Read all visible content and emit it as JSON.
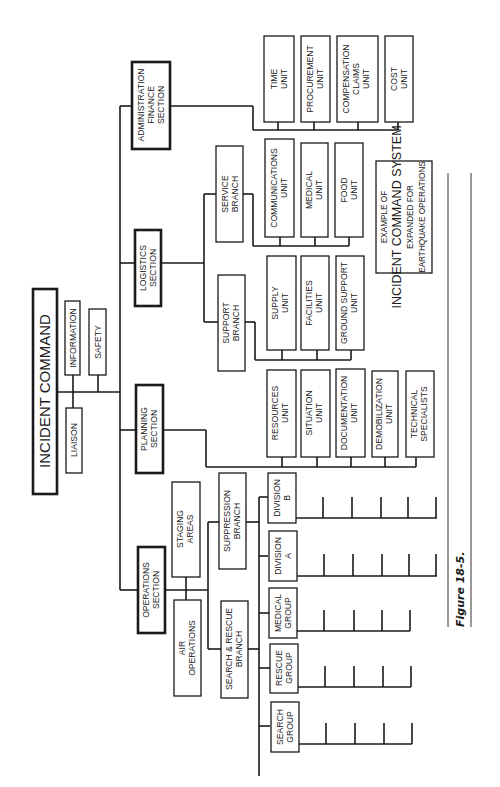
{
  "figure_label": "Figure 18-5.",
  "caption": {
    "line1": "EXAMPLE OF",
    "line2": "INCIDENT COMMAND SYSTEM",
    "line3": "EXPANDED FOR",
    "line4": "EARTHQUAKE OPERATIONS"
  },
  "command": {
    "title": "INCIDENT COMMAND",
    "staff": {
      "information": "INFORMATION",
      "safety": "SAFETY",
      "liaison": "LIAISON"
    }
  },
  "sections": {
    "admin": {
      "l1": "ADMINISTRATION",
      "l2": "FINANCE",
      "l3": "SECTION",
      "units": [
        {
          "l1": "TIME",
          "l2": "UNIT"
        },
        {
          "l1": "PROCUREMENT",
          "l2": "UNIT"
        },
        {
          "l1": "COMPENSATION",
          "l2": "CLAIMS",
          "l3": "UNIT"
        },
        {
          "l1": "COST",
          "l2": "UNIT"
        }
      ]
    },
    "logistics": {
      "l1": "LOGISTICS",
      "l2": "SECTION",
      "service_branch": {
        "l1": "SERVICE",
        "l2": "BRANCH",
        "units": [
          {
            "l1": "COMMUNICATIONS",
            "l2": "UNIT"
          },
          {
            "l1": "MEDICAL",
            "l2": "UNIT"
          },
          {
            "l1": "FOOD",
            "l2": "UNIT"
          }
        ]
      },
      "support_branch": {
        "l1": "SUPPORT",
        "l2": "BRANCH",
        "units": [
          {
            "l1": "SUPPLY",
            "l2": "UNIT"
          },
          {
            "l1": "FACILITIES",
            "l2": "UNIT"
          },
          {
            "l1": "GROUND SUPPORT",
            "l2": "UNIT"
          }
        ]
      }
    },
    "planning": {
      "l1": "PLANNING",
      "l2": "SECTION",
      "units": [
        {
          "l1": "RESOURCES",
          "l2": "UNIT"
        },
        {
          "l1": "SITUATION",
          "l2": "UNIT"
        },
        {
          "l1": "DOCUMENTATION",
          "l2": "UNIT"
        },
        {
          "l1": "DEMOBILIZATION",
          "l2": "UNIT"
        },
        {
          "l1": "TECHNICAL",
          "l2": "SPECIALISTS"
        }
      ]
    },
    "operations": {
      "l1": "OPERATIONS",
      "l2": "SECTION",
      "staging": {
        "l1": "STAGING",
        "l2": "AREAS"
      },
      "air": {
        "l1": "AIR",
        "l2": "OPERATIONS"
      },
      "suppression_branch": {
        "l1": "SUPPRESSION",
        "l2": "BRANCH",
        "divisions": [
          {
            "l1": "DIVISION",
            "l2": "B"
          },
          {
            "l1": "DIVISION",
            "l2": "A"
          }
        ]
      },
      "search_rescue_branch": {
        "l1": "SEARCH & RESCUE",
        "l2": "BRANCH",
        "groups": [
          {
            "l1": "MEDICAL",
            "l2": "GROUP"
          },
          {
            "l1": "RESCUE",
            "l2": "GROUP"
          },
          {
            "l1": "SEARCH",
            "l2": "GROUP"
          }
        ]
      }
    }
  }
}
